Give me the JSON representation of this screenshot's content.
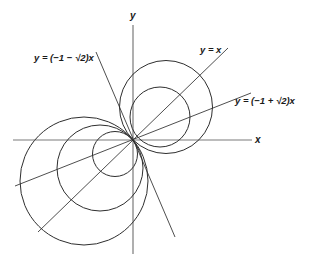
{
  "figure": {
    "axes": {
      "x_label": "x",
      "y_label": "y"
    },
    "lines": [
      {
        "id": "line-y-eq-x",
        "label": "y = x",
        "slope_expr": "1"
      },
      {
        "id": "line-y-eq-neg1-plus-sqrt2-x",
        "label": "y = (−1 + √2)x",
        "slope_expr": "-1+sqrt(2)"
      },
      {
        "id": "line-y-eq-neg1-minus-sqrt2-x",
        "label": "y = (−1 − √2)x",
        "slope_expr": "-1-sqrt(2)"
      }
    ],
    "circles": {
      "upper_right_count": 2,
      "lower_left_count": 3,
      "tangent_point": "origin"
    },
    "colors": {
      "background": "#ffffff",
      "stroke": "#2e2e2e",
      "axis": "#7a7a7a",
      "text": "#1a1a1a"
    }
  }
}
